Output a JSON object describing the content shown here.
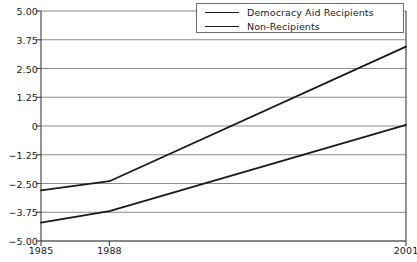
{
  "chart_data": {
    "type": "line",
    "title": "",
    "xlabel": "",
    "ylabel": "",
    "x": [
      1985,
      1988,
      2001
    ],
    "xtick_labels": [
      "1985",
      "1988",
      "2001"
    ],
    "ytick_labels": [
      "5.00",
      "3.75",
      "2.50",
      "1.25",
      "0",
      "-1.25",
      "-2.50",
      "-3.75",
      "-5.00"
    ],
    "ytick_values": [
      5.0,
      3.75,
      2.5,
      1.25,
      0,
      -1.25,
      -2.5,
      -3.75,
      -5.0
    ],
    "ylim": [
      -5.0,
      5.0
    ],
    "xlim": [
      1985,
      2001
    ],
    "grid": true,
    "grid_axis": "y",
    "legend_position": "top-right",
    "series": [
      {
        "name": "Democracy Aid Recipients",
        "values": [
          -2.8,
          -2.4,
          3.45
        ],
        "color": "#1a1a1a"
      },
      {
        "name": "Non-Recipients",
        "values": [
          -4.2,
          -3.7,
          0.05
        ],
        "color": "#1a1a1a"
      }
    ]
  },
  "legend": {
    "items": [
      {
        "label": "Democracy Aid Recipients"
      },
      {
        "label": "Non-Recipients"
      }
    ]
  },
  "colors": {
    "line": "#1a1a1a",
    "grid": "#8a8a8a",
    "axis": "#4d4d4d",
    "background": "#ffffff",
    "text": "#1a1a1a"
  }
}
